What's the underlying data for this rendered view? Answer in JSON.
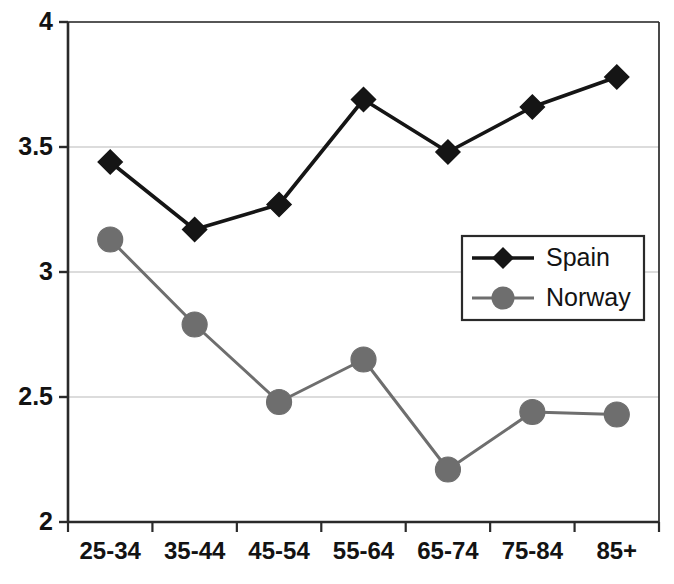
{
  "chart_data": {
    "type": "line",
    "title": "",
    "xlabel": "",
    "ylabel": "",
    "categories": [
      "25-34",
      "35-44",
      "45-54",
      "55-64",
      "65-74",
      "75-84",
      "85+"
    ],
    "series": [
      {
        "name": "Spain",
        "marker": "diamond",
        "color": "#151515",
        "values": [
          3.44,
          3.17,
          3.27,
          3.69,
          3.48,
          3.66,
          3.78
        ]
      },
      {
        "name": "Norway",
        "marker": "circle",
        "color": "#6e6e6e",
        "values": [
          3.13,
          2.79,
          2.48,
          2.65,
          2.21,
          2.44,
          2.43
        ]
      }
    ],
    "ylim": [
      2,
      4
    ],
    "yticks": [
      2,
      2.5,
      3,
      3.5,
      4
    ],
    "ytick_labels": [
      "2",
      "2.5",
      "3",
      "3.5",
      "4"
    ],
    "grid": true,
    "grid_color": "#d0d0d0",
    "axis_color": "#2a2a2a",
    "legend_position": "upper-right"
  },
  "legend": {
    "entries": [
      {
        "label": "Spain"
      },
      {
        "label": "Norway"
      }
    ]
  },
  "scan": {
    "top_fragment": "·  ·  ·   ·    ·  ·   ·    ·   ·  ·"
  }
}
